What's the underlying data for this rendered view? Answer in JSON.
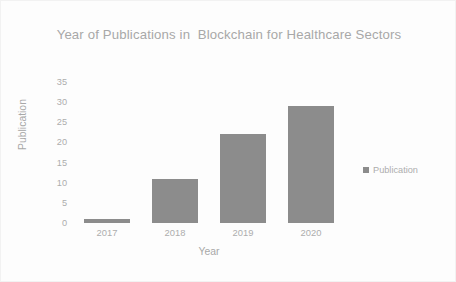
{
  "chart_data": {
    "type": "bar",
    "title": "Year of Publications in  Blockchain for Healthcare Sectors",
    "categories": [
      "2017",
      "2018",
      "2019",
      "2020"
    ],
    "values": [
      1,
      11,
      22,
      29
    ],
    "series": [
      {
        "name": "Publication",
        "values": [
          1,
          11,
          22,
          29
        ]
      }
    ],
    "xlabel": "Year",
    "ylabel": "Publication",
    "ylim": [
      0,
      35
    ],
    "ytick_step": 5,
    "yticks": [
      "35",
      "30",
      "25",
      "20",
      "15",
      "10",
      "5",
      "0"
    ],
    "ytick_values": [
      35,
      30,
      25,
      20,
      15,
      10,
      5,
      0
    ],
    "grid": false,
    "legend": {
      "position": "right",
      "entries": [
        {
          "label": "Publication",
          "color": "#8c8c8c"
        }
      ]
    },
    "colors": {
      "bar": "#8c8c8c",
      "text": "#a8a8a8",
      "tick_text": "#adadad",
      "background": "#fdfdfd",
      "border": "#f2f2f2"
    }
  }
}
